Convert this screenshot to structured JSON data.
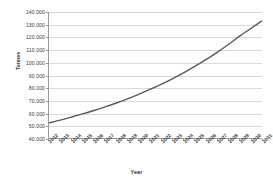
{
  "chart_data": {
    "type": "line",
    "title": "",
    "xlabel": "Year",
    "ylabel": "Tonnes",
    "categories": [
      "2012",
      "2013",
      "2014",
      "2015",
      "2016",
      "2017",
      "2018",
      "2019",
      "2020",
      "2021",
      "2022",
      "2023",
      "2024",
      "2025",
      "2026",
      "2027",
      "2028",
      "2029",
      "2030",
      "2031"
    ],
    "series": [
      {
        "name": "Tonnes",
        "color": "#59595b",
        "values": [
          52000,
          54200,
          56600,
          59100,
          61800,
          64700,
          67800,
          71100,
          74700,
          78500,
          82600,
          87000,
          91700,
          96800,
          102200,
          108000,
          114200,
          120800,
          126900,
          133000
        ]
      }
    ],
    "ylim": [
      40000,
      140000
    ],
    "yticks": [
      40000,
      50000,
      60000,
      70000,
      80000,
      90000,
      100000,
      110000,
      120000,
      130000,
      140000
    ],
    "ytick_labels": [
      "40.000",
      "50.000",
      "60.000",
      "70.000",
      "80.000",
      "90.000",
      "100.000",
      "110.000",
      "120.000",
      "130.000",
      "140.000"
    ],
    "grid": true,
    "legend": "none",
    "gridline_color": "#d9d9d9",
    "axis_color": "#9a9a9a",
    "background": "#ffffff"
  }
}
